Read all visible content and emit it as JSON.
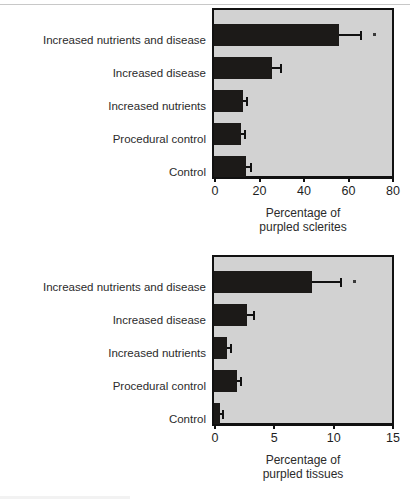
{
  "figure": {
    "categories": [
      "Increased nutrients and disease",
      "Increased disease",
      "Increased nutrients",
      "Procedural control",
      "Control"
    ]
  },
  "chart_data": [
    {
      "type": "bar",
      "orientation": "horizontal",
      "panel": "top",
      "title": "",
      "xlabel_line1": "Percentage of",
      "xlabel_line2": "purpled sclerites",
      "ylabel": "",
      "categories": [
        "Increased nutrients and disease",
        "Increased disease",
        "Increased nutrients",
        "Procedural control",
        "Control"
      ],
      "values": [
        56,
        26,
        13,
        12,
        14.5
      ],
      "errors": [
        9.5,
        3.5,
        1.5,
        1.5,
        1.5
      ],
      "significance": [
        "*",
        "",
        "",
        "",
        ""
      ],
      "xlim": [
        0,
        80
      ],
      "xticks": [
        0,
        20,
        40,
        60,
        80
      ],
      "xtick_labels": [
        "0",
        "20",
        "40",
        "60",
        "80"
      ],
      "grid": false,
      "legend": "none",
      "bar_color": "#1c1a18",
      "plot_background": "#d2d2d2"
    },
    {
      "type": "bar",
      "orientation": "horizontal",
      "panel": "bottom",
      "title": "",
      "xlabel_line1": "Percentage of",
      "xlabel_line2": "purpled tissues",
      "ylabel": "",
      "categories": [
        "Increased nutrients and disease",
        "Increased disease",
        "Increased nutrients",
        "Procedural control",
        "Control"
      ],
      "values": [
        8.3,
        2.8,
        1.1,
        1.9,
        0.5
      ],
      "errors": [
        2.3,
        0.45,
        0.25,
        0.3,
        0.15
      ],
      "significance": [
        "*",
        "",
        "",
        "",
        ""
      ],
      "xlim": [
        0,
        15
      ],
      "xticks": [
        0,
        5,
        10,
        15
      ],
      "xtick_labels": [
        "0",
        "5",
        "10",
        "15"
      ],
      "grid": false,
      "legend": "none",
      "bar_color": "#1c1a18",
      "plot_background": "#d2d2d2"
    }
  ]
}
